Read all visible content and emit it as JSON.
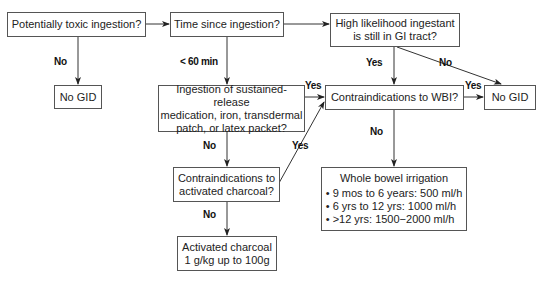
{
  "diagram": {
    "nodes": {
      "toxic": "Potentially toxic ingestion?",
      "time": "Time since ingestion?",
      "likelihood_l1": "High likelihood ingestant",
      "likelihood_l2": "is still in GI tract?",
      "nogid_left": "No GID",
      "sustained_l1": "Ingestion of sustained-release",
      "sustained_l2": "medication, iron, transdermal",
      "sustained_l3": "patch, or latex packet?",
      "wbi_contra": "Contraindications to WBI?",
      "nogid_right": "No GID",
      "charcoal_contra_l1": "Contraindications to",
      "charcoal_contra_l2": "activated charcoal?",
      "charcoal_l1": "Activated charcoal",
      "charcoal_l2": "1 g/kg up to 100g",
      "wbi_title": "Whole bowel irrigation",
      "wbi_items": [
        "• 9 mos to 6 years: 500 ml/h",
        "• 6 yrs to 12 yrs: 1000 ml/h",
        "• >12 yrs: 1500−2000 ml/h"
      ]
    },
    "edge_labels": {
      "toxic_no": "No",
      "time_lt60": "< 60 min",
      "likelihood_yes": "Yes",
      "likelihood_no": "No",
      "sustained_yes": "Yes",
      "sustained_no": "No",
      "charcoal_contra_yes": "Yes",
      "charcoal_contra_no": "No",
      "wbi_contra_yes": "Yes",
      "wbi_contra_no": "No"
    },
    "colors": {
      "line": "#333333",
      "border": "#555555",
      "text": "#222222"
    }
  }
}
